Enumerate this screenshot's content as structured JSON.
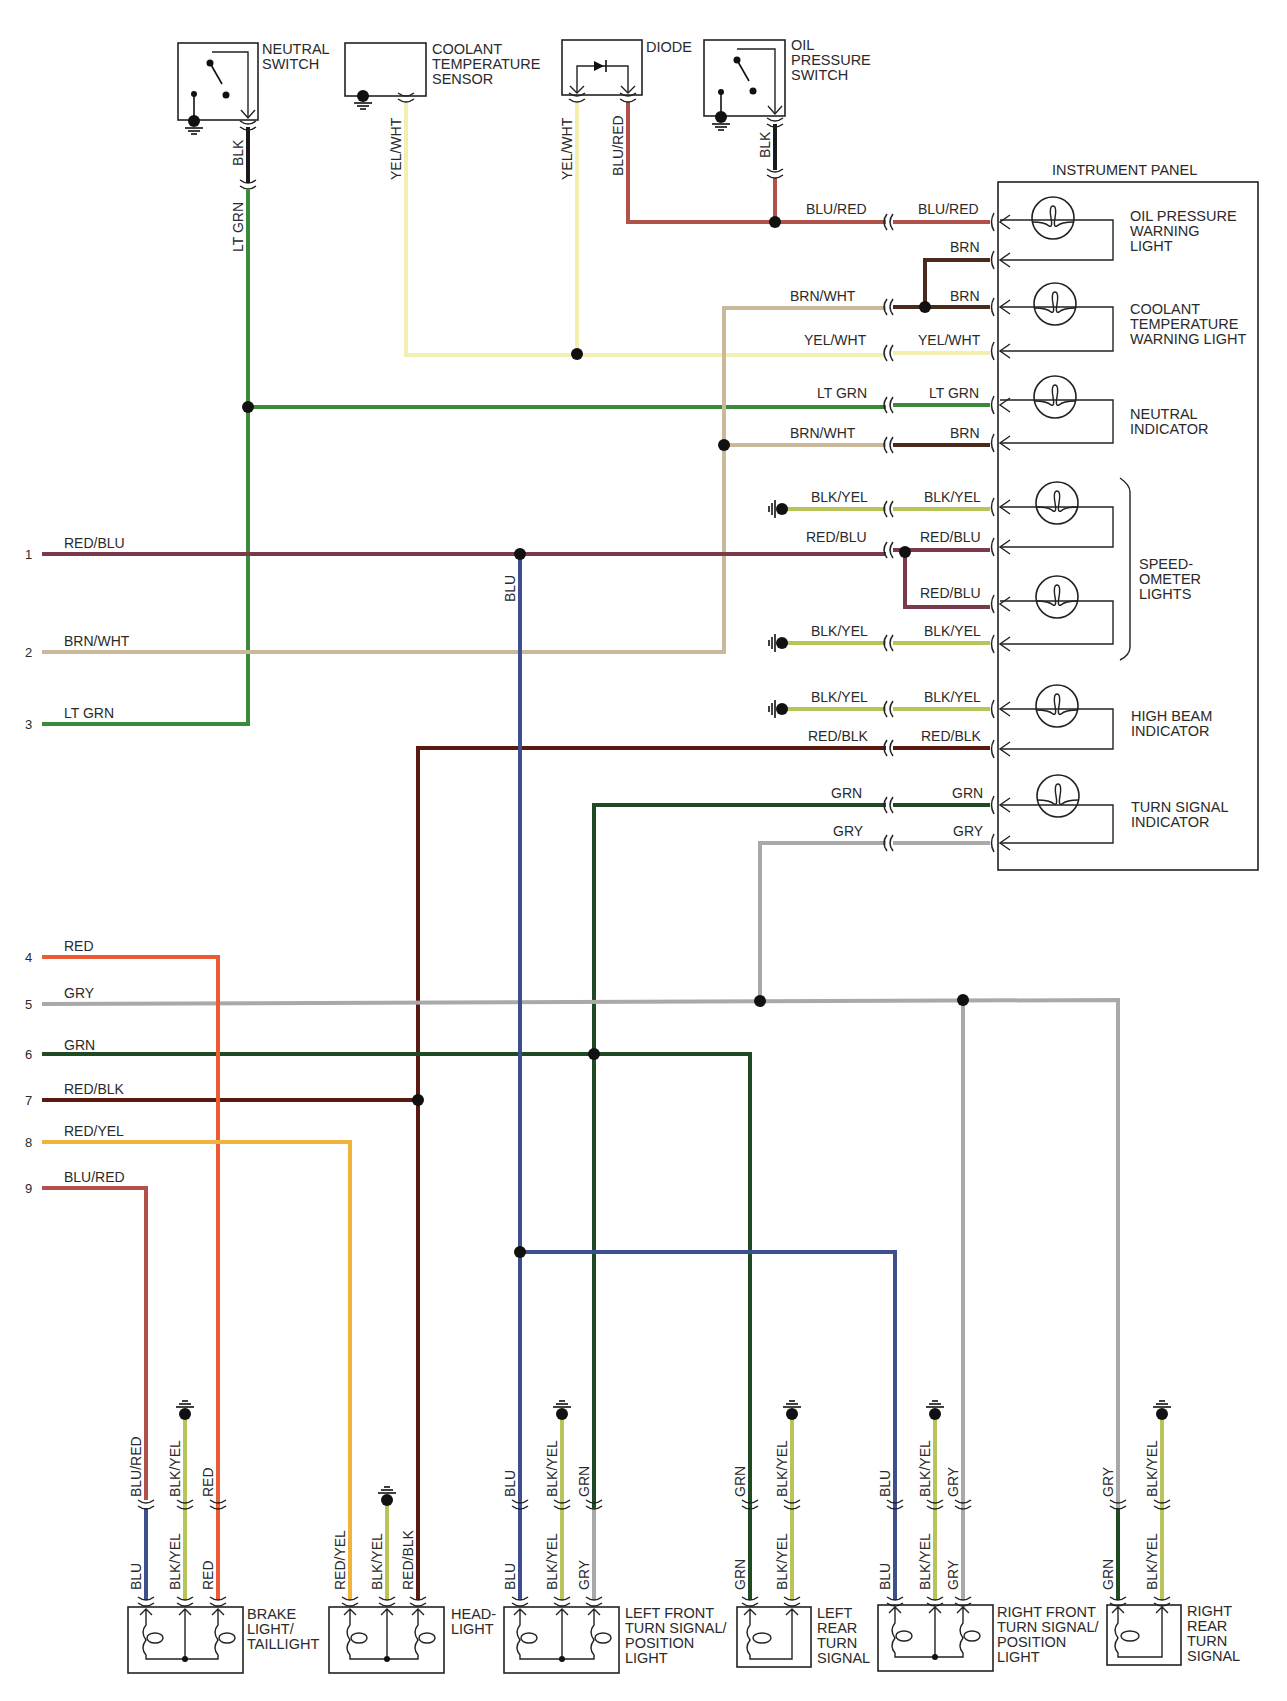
{
  "colors": {
    "BLK": "#1a1a1a",
    "LT_GRN": "#3a8a3c",
    "GRN": "#1f4a24",
    "YEL_WHT": "#f2efb0",
    "BLU_RED": "#b0524a",
    "BRN": "#4a2a1a",
    "BRN_WHT": "#c9b89a",
    "RED_BLU": "#7a3a4a",
    "BLK_YEL": "#b8c458",
    "RED_BLK": "#5a1a12",
    "GRY": "#a9a9a9",
    "RED": "#ec5a34",
    "RED_YEL": "#f0b43a",
    "BLU": "#3e4f8e"
  },
  "components": {
    "neutral_switch": [
      "NEUTRAL",
      "SWITCH"
    ],
    "coolant_sensor": [
      "COOLANT",
      "TEMPERATURE",
      "SENSOR"
    ],
    "diode": [
      "DIODE"
    ],
    "oil_pressure_switch": [
      "OIL",
      "PRESSURE",
      "SWITCH"
    ],
    "instrument_panel": "INSTRUMENT PANEL",
    "oil_light": [
      "OIL PRESSURE",
      "WARNING",
      "LIGHT"
    ],
    "coolant_light": [
      "COOLANT",
      "TEMPERATURE",
      "WARNING LIGHT"
    ],
    "neutral_indicator": [
      "NEUTRAL",
      "INDICATOR"
    ],
    "speedometer_lights": [
      "SPEED-",
      "OMETER",
      "LIGHTS"
    ],
    "high_beam": [
      "HIGH BEAM",
      "INDICATOR"
    ],
    "turn_indicator": [
      "TURN SIGNAL",
      "INDICATOR"
    ],
    "brake_light": [
      "BRAKE",
      "LIGHT/",
      "TAILLIGHT"
    ],
    "headlight": [
      "HEAD-",
      "LIGHT"
    ],
    "left_front": [
      "LEFT FRONT",
      "TURN SIGNAL/",
      "POSITION",
      "LIGHT"
    ],
    "left_rear": [
      "LEFT",
      "REAR",
      "TURN",
      "SIGNAL"
    ],
    "right_front": [
      "RIGHT FRONT",
      "TURN SIGNAL/",
      "POSITION",
      "LIGHT"
    ],
    "right_rear": [
      "RIGHT",
      "REAR",
      "TURN",
      "SIGNAL"
    ]
  },
  "top_wire_labels": {
    "neutral_blk": "BLK",
    "neutral_ltgrn": "LT GRN",
    "coolant_yelwht": "YEL/WHT",
    "diode_yelwht": "YEL/WHT",
    "diode_blured": "BLU/RED",
    "oil_blk": "BLK"
  },
  "panel_wires": [
    {
      "left": "BLU/RED",
      "right": "BLU/RED"
    },
    {
      "left": "",
      "right": "BRN"
    },
    {
      "left": "BRN/WHT",
      "right": "BRN"
    },
    {
      "left": "YEL/WHT",
      "right": "YEL/WHT"
    },
    {
      "left": "LT GRN",
      "right": "LT GRN"
    },
    {
      "left": "BRN/WHT",
      "right": "BRN"
    },
    {
      "left": "BLK/YEL",
      "right": "BLK/YEL"
    },
    {
      "left": "RED/BLU",
      "right": "RED/BLU"
    },
    {
      "left": "",
      "right": "RED/BLU"
    },
    {
      "left": "BLK/YEL",
      "right": "BLK/YEL"
    },
    {
      "left": "BLK/YEL",
      "right": "BLK/YEL"
    },
    {
      "left": "RED/BLK",
      "right": "RED/BLK"
    },
    {
      "left": "GRN",
      "right": "GRN"
    },
    {
      "left": "GRY",
      "right": "GRY"
    }
  ],
  "harness_lines": [
    {
      "num": "1",
      "label": "RED/BLU"
    },
    {
      "num": "2",
      "label": "BRN/WHT"
    },
    {
      "num": "3",
      "label": "LT GRN"
    },
    {
      "num": "4",
      "label": "RED"
    },
    {
      "num": "5",
      "label": "GRY"
    },
    {
      "num": "6",
      "label": "GRN"
    },
    {
      "num": "7",
      "label": "RED/BLK"
    },
    {
      "num": "8",
      "label": "RED/YEL"
    },
    {
      "num": "9",
      "label": "BLU/RED"
    }
  ],
  "blu_trunk_label": "BLU",
  "bottom_wires": {
    "brake": {
      "upper": [
        "BLU/RED",
        "BLK/YEL",
        "RED"
      ],
      "lower": [
        "BLU",
        "BLK/YEL",
        "RED"
      ]
    },
    "headlight": {
      "lower": [
        "RED/YEL",
        "BLK/YEL",
        "RED/BLK"
      ]
    },
    "left_front": {
      "upper": [
        "BLU",
        "BLK/YEL",
        "GRN"
      ],
      "lower": [
        "BLU",
        "BLK/YEL",
        "GRY"
      ]
    },
    "left_rear": {
      "upper": [
        "GRN",
        "BLK/YEL"
      ],
      "lower": [
        "GRN",
        "BLK/YEL"
      ]
    },
    "right_front": {
      "upper": [
        "BLU",
        "BLK/YEL",
        "GRY"
      ],
      "lower": [
        "BLU",
        "BLK/YEL",
        "GRY"
      ]
    },
    "right_rear": {
      "upper": [
        "GRY",
        "BLK/YEL"
      ],
      "lower": [
        "GRN",
        "BLK/YEL"
      ]
    }
  }
}
